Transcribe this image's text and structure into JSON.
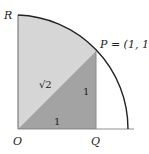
{
  "diagram": {
    "type": "geometry",
    "points": {
      "O": {
        "label": "O"
      },
      "Q": {
        "label": "Q"
      },
      "R": {
        "label": "R"
      },
      "P": {
        "label": "P = (1, 1)"
      }
    },
    "segment_labels": {
      "hypotenuse_OP": "√2",
      "vertical_PQ": "1",
      "horizontal_OQ": "1"
    },
    "colors": {
      "sector_fill": "#d6d6d6",
      "triangle_fill": "#a3a3a3",
      "outline": "#222222",
      "axis": "#555555",
      "background": "#ffffff"
    }
  }
}
